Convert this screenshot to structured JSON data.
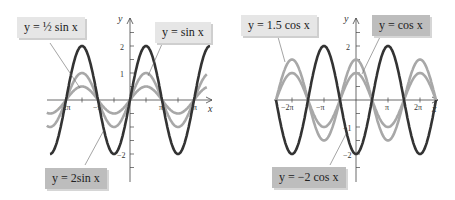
{
  "colors": {
    "dark_curve": "#333333",
    "light_curve": "#a8a8a8",
    "axis": "#444444",
    "label_light_bg": "#e6e6e6",
    "label_dark_bg": "#bdbdbd"
  },
  "left": {
    "labels": {
      "half_sin": "y = ½ sin x",
      "sin": "y = sin x",
      "two_sin": "y = 2sin x"
    },
    "axis": {
      "x": "x",
      "y": "y"
    },
    "xticks": [
      "−2π",
      "−π",
      "π",
      "2π"
    ],
    "yticks": [
      "2",
      "1",
      "−2"
    ]
  },
  "right": {
    "labels": {
      "one_five_cos": "y = 1.5 cos x",
      "cos": "y = cos x",
      "neg_two_cos": "y = −2 cos x"
    },
    "axis": {
      "x": "x",
      "y": "y"
    },
    "xticks": [
      "−2π",
      "−π",
      "π",
      "2π"
    ],
    "yticks": [
      "2",
      "−1",
      "−2"
    ]
  },
  "chart_data": [
    {
      "type": "line",
      "title": "",
      "xlabel": "x",
      "ylabel": "y",
      "xlim": [
        -2.4,
        2.4
      ],
      "xlim_units": "multiples of π",
      "ylim": [
        -2.8,
        2.8
      ],
      "grid": false,
      "x_tick_labels": [
        "−2π",
        "−π",
        "π",
        "2π"
      ],
      "y_tick_labels": [
        "2",
        "1",
        "−2"
      ],
      "series": [
        {
          "name": "y = ½ sin x",
          "function": "0.5*sin(x)",
          "amplitude": 0.5,
          "color": "#a8a8a8"
        },
        {
          "name": "y = sin x",
          "function": "sin(x)",
          "amplitude": 1,
          "color": "#a8a8a8"
        },
        {
          "name": "y = 2sin x",
          "function": "2*sin(x)",
          "amplitude": 2,
          "color": "#333333"
        }
      ]
    },
    {
      "type": "line",
      "title": "",
      "xlabel": "x",
      "ylabel": "y",
      "xlim": [
        -2.4,
        2.4
      ],
      "xlim_units": "multiples of π",
      "ylim": [
        -2.8,
        2.8
      ],
      "grid": false,
      "x_tick_labels": [
        "−2π",
        "−π",
        "π",
        "2π"
      ],
      "y_tick_labels": [
        "2",
        "−1",
        "−2"
      ],
      "series": [
        {
          "name": "y = 1.5 cos x",
          "function": "1.5*cos(x)",
          "amplitude": 1.5,
          "color": "#a8a8a8"
        },
        {
          "name": "y = cos x",
          "function": "cos(x)",
          "amplitude": 1,
          "color": "#a8a8a8"
        },
        {
          "name": "y = −2 cos x",
          "function": "-2*cos(x)",
          "amplitude": 2,
          "color": "#333333"
        }
      ]
    }
  ]
}
